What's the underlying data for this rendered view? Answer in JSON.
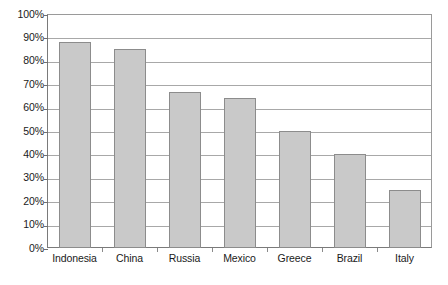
{
  "chart_data": {
    "type": "bar",
    "title": "",
    "xlabel": "",
    "ylabel": "",
    "categories": [
      "Indonesia",
      "China",
      "Russia",
      "Mexico",
      "Greece",
      "Brazil",
      "Italy"
    ],
    "values": [
      88,
      85,
      66.5,
      64,
      50,
      40,
      25
    ],
    "value_suffix": "%",
    "ylim": [
      0,
      100
    ],
    "ytick_step": 10,
    "ytick_labels": [
      "100%",
      "90%",
      "80%",
      "70%",
      "60%",
      "50%",
      "40%",
      "30%",
      "20%",
      "10%",
      "0%"
    ],
    "ytick_values": [
      100,
      90,
      80,
      70,
      60,
      50,
      40,
      30,
      20,
      10,
      0
    ],
    "grid": true,
    "grid_axis": "y",
    "legend": false,
    "legend_position": "none",
    "series": [
      {
        "name": "",
        "values": [
          88,
          85,
          66.5,
          64,
          50,
          40,
          25
        ]
      }
    ]
  },
  "style": {
    "bar_fill": "#c9c9c9",
    "bar_border": "#8c8c8c",
    "gridline_color": "#a8a8a8",
    "axis_color": "#7a7a7a",
    "text_color": "#1a1a1a",
    "background": "#ffffff"
  }
}
